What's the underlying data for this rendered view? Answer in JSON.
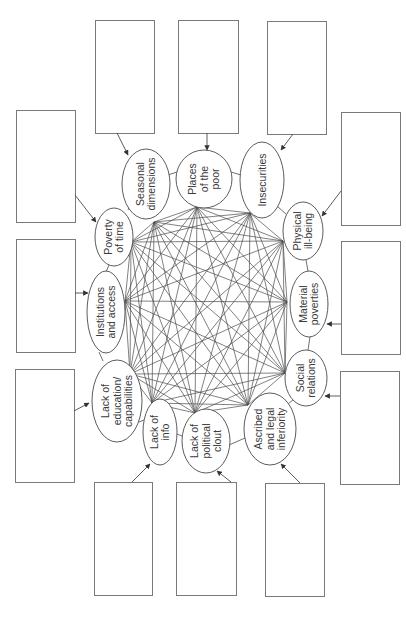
{
  "diagram": {
    "type": "network-with-annotation-boxes",
    "orientation": "rotated-90-ccw",
    "colors": {
      "stroke": "#4a4a4a",
      "box_stroke": "#7a7a7a",
      "text": "#3a3a3a",
      "background": "#ffffff"
    },
    "nodes": [
      {
        "id": "seasonal",
        "label_lines": [
          "Seasonal",
          "dimensions"
        ],
        "ellipse": {
          "cx": 146,
          "cy": 184,
          "rx": 24,
          "ry": 35
        },
        "hub": [
          154,
          222
        ]
      },
      {
        "id": "places",
        "label_lines": [
          "Places",
          "of the",
          "poor"
        ],
        "ellipse": {
          "cx": 204,
          "cy": 179,
          "rx": 28,
          "ry": 29
        },
        "hub": [
          197,
          207
        ]
      },
      {
        "id": "insecurities",
        "label_lines": [
          "Insecurities"
        ],
        "ellipse": {
          "cx": 262,
          "cy": 180,
          "rx": 22,
          "ry": 38
        },
        "hub": [
          250,
          213
        ]
      },
      {
        "id": "physical",
        "label_lines": [
          "Physical",
          "ill-being"
        ],
        "ellipse": {
          "cx": 303,
          "cy": 231,
          "rx": 20,
          "ry": 29
        },
        "hub": [
          283,
          241
        ]
      },
      {
        "id": "material",
        "label_lines": [
          "Material",
          "poverties"
        ],
        "ellipse": {
          "cx": 309,
          "cy": 304,
          "rx": 19,
          "ry": 33
        },
        "hub": [
          287,
          302
        ]
      },
      {
        "id": "social",
        "label_lines": [
          "Social",
          "relations"
        ],
        "ellipse": {
          "cx": 306,
          "cy": 378,
          "rx": 21,
          "ry": 28
        },
        "hub": [
          285,
          373
        ]
      },
      {
        "id": "ascribed",
        "label_lines": [
          "Ascribed",
          "and legal",
          "inferiority"
        ],
        "ellipse": {
          "cx": 270,
          "cy": 429,
          "rx": 26,
          "ry": 36
        },
        "hub": [
          248,
          405
        ]
      },
      {
        "id": "political",
        "label_lines": [
          "Lack of",
          "political",
          "clout"
        ],
        "ellipse": {
          "cx": 206,
          "cy": 441,
          "rx": 24,
          "ry": 32
        },
        "hub": [
          195,
          413
        ]
      },
      {
        "id": "info",
        "label_lines": [
          "Lack of",
          "info"
        ],
        "ellipse": {
          "cx": 160,
          "cy": 432,
          "rx": 17,
          "ry": 33
        },
        "hub": [
          152,
          403
        ]
      },
      {
        "id": "education",
        "label_lines": [
          "Lack of",
          "education/",
          "capabilities"
        ],
        "ellipse": {
          "cx": 117,
          "cy": 401,
          "rx": 25,
          "ry": 41
        },
        "hub": [
          130,
          374
        ]
      },
      {
        "id": "institutions",
        "label_lines": [
          "Institutions",
          "and access"
        ],
        "ellipse": {
          "cx": 106,
          "cy": 312,
          "rx": 19,
          "ry": 41
        },
        "hub": [
          125,
          301
        ]
      },
      {
        "id": "time",
        "label_lines": [
          "Poverty",
          "of time"
        ],
        "ellipse": {
          "cx": 114,
          "cy": 237,
          "rx": 19,
          "ry": 29
        },
        "hub": [
          131,
          242
        ]
      }
    ],
    "ring_links": [
      {
        "from": [
          168,
          175
        ],
        "to": [
          177,
          172
        ]
      },
      {
        "from": [
          231,
          172
        ],
        "to": [
          241,
          175
        ]
      },
      {
        "from": [
          277,
          206
        ],
        "to": [
          286,
          214
        ]
      },
      {
        "from": [
          306,
          260
        ],
        "to": [
          308,
          271
        ]
      },
      {
        "from": [
          310,
          337
        ],
        "to": [
          308,
          350
        ]
      },
      {
        "from": [
          293,
          400
        ],
        "to": [
          288,
          404
        ]
      },
      {
        "from": [
          229,
          445
        ],
        "to": [
          245,
          438
        ]
      },
      {
        "from": [
          177,
          434
        ],
        "to": [
          182,
          436
        ]
      },
      {
        "from": [
          139,
          422
        ],
        "to": [
          144,
          420
        ]
      },
      {
        "from": [
          99,
          352
        ],
        "to": [
          103,
          361
        ]
      },
      {
        "from": [
          109,
          265
        ],
        "to": [
          106,
          272
        ]
      },
      {
        "from": [
          128,
          210
        ],
        "to": [
          130,
          205
        ]
      }
    ],
    "boxes": [
      {
        "id": "box-top-1",
        "x": 95,
        "y": 20,
        "w": 59,
        "h": 113,
        "arrow": {
          "from": [
            117,
            133
          ],
          "to": [
            128,
            155
          ]
        },
        "text": ""
      },
      {
        "id": "box-top-2",
        "x": 178,
        "y": 20,
        "w": 60,
        "h": 113,
        "arrow": {
          "from": [
            207,
            133
          ],
          "to": [
            207,
            150
          ]
        },
        "text": ""
      },
      {
        "id": "box-top-3",
        "x": 267,
        "y": 21,
        "w": 59,
        "h": 113,
        "arrow": {
          "from": [
            293,
            134
          ],
          "to": [
            281,
            150
          ]
        },
        "text": ""
      },
      {
        "id": "box-right-1",
        "x": 341,
        "y": 112,
        "w": 59,
        "h": 113,
        "arrow": {
          "from": [
            341,
            191
          ],
          "to": [
            322,
            216
          ]
        },
        "text": ""
      },
      {
        "id": "box-right-2",
        "x": 341,
        "y": 241,
        "w": 59,
        "h": 113,
        "arrow": {
          "from": [
            341,
            324
          ],
          "to": [
            327,
            324
          ]
        },
        "text": ""
      },
      {
        "id": "box-right-3",
        "x": 340,
        "y": 371,
        "w": 59,
        "h": 113,
        "arrow": {
          "from": [
            340,
            396
          ],
          "to": [
            325,
            396
          ]
        },
        "text": ""
      },
      {
        "id": "box-bottom-3",
        "x": 265,
        "y": 483,
        "w": 59,
        "h": 113,
        "arrow": {
          "from": [
            300,
            483
          ],
          "to": [
            281,
            464
          ]
        },
        "text": ""
      },
      {
        "id": "box-bottom-2",
        "x": 176,
        "y": 482,
        "w": 60,
        "h": 113,
        "arrow": {
          "from": [
            231,
            482
          ],
          "to": [
            217,
            471
          ]
        },
        "text": ""
      },
      {
        "id": "box-bottom-1",
        "x": 94,
        "y": 482,
        "w": 58,
        "h": 113,
        "arrow": {
          "from": [
            132,
            482
          ],
          "to": [
            150,
            464
          ]
        },
        "text": ""
      },
      {
        "id": "box-left-3",
        "x": 15,
        "y": 369,
        "w": 59,
        "h": 113,
        "arrow": {
          "from": [
            74,
            411
          ],
          "to": [
            89,
            403
          ]
        },
        "text": ""
      },
      {
        "id": "box-left-2",
        "x": 16,
        "y": 239,
        "w": 59,
        "h": 113,
        "arrow": {
          "from": [
            75,
            293
          ],
          "to": [
            88,
            293
          ]
        },
        "text": ""
      },
      {
        "id": "box-left-1",
        "x": 16,
        "y": 110,
        "w": 59,
        "h": 112,
        "arrow": {
          "from": [
            75,
            195
          ],
          "to": [
            96,
            222
          ]
        },
        "text": ""
      }
    ]
  }
}
